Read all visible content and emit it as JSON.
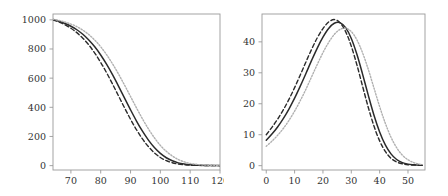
{
  "figure": {
    "background": "#ffffff",
    "panel_count": 2,
    "frame_color": "#9a9a9a",
    "tick_label_color": "#333333"
  },
  "chart_data": [
    {
      "panel": "left",
      "type": "line",
      "title": "",
      "xlabel": "",
      "ylabel": "",
      "xlim": [
        64,
        120
      ],
      "ylim": [
        -30,
        1040
      ],
      "grid": false,
      "legend": "none",
      "xticks": [
        70,
        80,
        90,
        100,
        110,
        120
      ],
      "yticks": [
        0,
        200,
        400,
        600,
        800,
        1000
      ],
      "xtick_labels": [
        "70",
        "80",
        "90",
        "100",
        "110",
        "120"
      ],
      "ytick_labels": [
        "0",
        "200",
        "400",
        "600",
        "800",
        "1000"
      ],
      "x": [
        64,
        66,
        68,
        70,
        72,
        74,
        76,
        78,
        80,
        82,
        84,
        86,
        88,
        90,
        92,
        94,
        96,
        98,
        100,
        102,
        104,
        106,
        108,
        110,
        112,
        114,
        116,
        118,
        120
      ],
      "series": [
        {
          "name": "dashed-curve",
          "style": "dashed",
          "color": "#2b2b2b",
          "width": 1.4,
          "values": [
            1000,
            985,
            966,
            942,
            912,
            874,
            828,
            772,
            708,
            636,
            558,
            477,
            396,
            318,
            246,
            183,
            130,
            88,
            56,
            34,
            20,
            11,
            6,
            3,
            2,
            1,
            1,
            0,
            0
          ]
        },
        {
          "name": "solid-curve",
          "style": "solid",
          "color": "#2b2b2b",
          "width": 1.5,
          "values": [
            1002,
            990,
            975,
            956,
            932,
            901,
            862,
            815,
            759,
            694,
            622,
            544,
            463,
            383,
            306,
            236,
            175,
            124,
            84,
            54,
            33,
            19,
            11,
            6,
            3,
            2,
            1,
            1,
            0
          ]
        },
        {
          "name": "dotted-gray-curve",
          "style": "dotted",
          "color": "#b0b0b0",
          "width": 1.4,
          "values": [
            1004,
            996,
            985,
            971,
            953,
            929,
            899,
            861,
            815,
            760,
            697,
            627,
            552,
            474,
            396,
            321,
            252,
            191,
            139,
            98,
            66,
            42,
            26,
            15,
            9,
            5,
            3,
            2,
            1
          ]
        }
      ]
    },
    {
      "panel": "right",
      "type": "line",
      "title": "",
      "xlabel": "",
      "ylabel": "",
      "xlim": [
        -1.5,
        56
      ],
      "ylim": [
        -1.4,
        49
      ],
      "grid": false,
      "legend": "none",
      "xticks": [
        0,
        10,
        20,
        30,
        40,
        50
      ],
      "yticks": [
        0,
        10,
        20,
        30,
        40
      ],
      "xtick_labels": [
        "0",
        "10",
        "20",
        "30",
        "40",
        "50"
      ],
      "ytick_labels": [
        "0",
        "10",
        "20",
        "30",
        "40"
      ],
      "x": [
        0,
        2,
        4,
        6,
        8,
        10,
        12,
        14,
        16,
        18,
        20,
        22,
        24,
        26,
        28,
        30,
        32,
        34,
        36,
        38,
        40,
        42,
        44,
        46,
        48,
        50,
        52,
        54,
        55
      ],
      "series": [
        {
          "name": "dashed-curve",
          "style": "dashed",
          "color": "#2b2b2b",
          "width": 1.4,
          "values": [
            10.0,
            12.4,
            15.0,
            18.0,
            21.4,
            25.2,
            29.3,
            33.5,
            37.6,
            41.3,
            44.3,
            46.4,
            47.2,
            46.2,
            43.3,
            38.6,
            32.5,
            25.6,
            18.8,
            12.8,
            8.0,
            4.6,
            2.4,
            1.2,
            0.6,
            0.3,
            0.2,
            0.1,
            0.1
          ]
        },
        {
          "name": "solid-curve",
          "style": "solid",
          "color": "#2b2b2b",
          "width": 1.5,
          "values": [
            8.2,
            10.2,
            12.5,
            15.2,
            18.3,
            21.8,
            25.7,
            29.8,
            34.0,
            38.0,
            41.5,
            44.3,
            46.0,
            46.2,
            44.6,
            41.1,
            35.9,
            29.5,
            22.7,
            16.3,
            10.9,
            6.7,
            3.8,
            2.0,
            1.0,
            0.5,
            0.3,
            0.2,
            0.1
          ]
        },
        {
          "name": "dotted-gray-curve",
          "style": "dotted",
          "color": "#b0b0b0",
          "width": 1.4,
          "values": [
            6.3,
            7.9,
            9.8,
            12.0,
            14.6,
            17.6,
            21.0,
            24.7,
            28.7,
            32.7,
            36.5,
            39.8,
            42.4,
            44.0,
            44.4,
            43.3,
            40.6,
            36.4,
            31.1,
            25.1,
            19.1,
            13.7,
            9.2,
            5.8,
            3.4,
            1.9,
            1.0,
            0.5,
            0.4
          ]
        }
      ]
    }
  ]
}
